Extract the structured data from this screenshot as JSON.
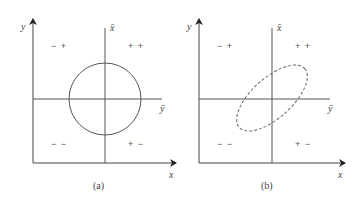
{
  "diagram": {
    "stroke_color": "#555555",
    "panels": [
      {
        "id": "a",
        "caption": "(a)",
        "y_axis_label": "y",
        "x_axis_label": "x",
        "mean_x_label": "x̄",
        "mean_y_label": "ȳ",
        "quadrants": {
          "top_left": "− +",
          "top_right": "+ +",
          "bottom_left": "− −",
          "bottom_right": "+ −"
        },
        "shape": "circle",
        "shape_style": "solid"
      },
      {
        "id": "b",
        "caption": "(b)",
        "y_axis_label": "y",
        "x_axis_label": "x",
        "mean_x_label": "x̄",
        "mean_y_label": "ȳ",
        "quadrants": {
          "top_left": "− +",
          "top_right": "+ +",
          "bottom_left": "− −",
          "bottom_right": "+ −"
        },
        "shape": "ellipse",
        "shape_style": "dashed"
      }
    ]
  }
}
